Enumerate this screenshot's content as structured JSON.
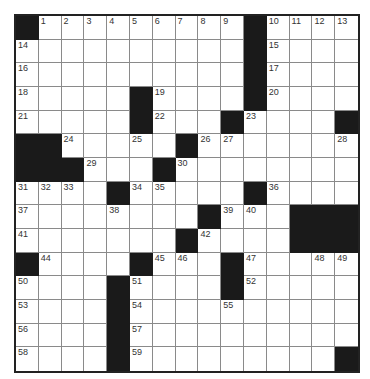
{
  "puzzle": {
    "rows": 15,
    "cols": 15,
    "colors": {
      "block": "#1a1a1a",
      "cell": "#ffffff",
      "gridline": "#8a8a8a",
      "border": "#222222",
      "number": "#333333"
    },
    "layout": [
      "#.........#....",
      "..........#....",
      "..........#....",
      ".....#....#....",
      ".....#...#....#",
      "##.....#.......",
      "###...#........",
      "....#.....#....",
      "........#...###",
      ".......#....###",
      "#....#...#.....",
      "....#....#.....",
      "....#..........",
      "....#..........",
      "....#.........#"
    ],
    "numbers": [
      {
        "r": 0,
        "c": 1,
        "n": "1"
      },
      {
        "r": 0,
        "c": 2,
        "n": "2"
      },
      {
        "r": 0,
        "c": 3,
        "n": "3"
      },
      {
        "r": 0,
        "c": 4,
        "n": "4"
      },
      {
        "r": 0,
        "c": 5,
        "n": "5"
      },
      {
        "r": 0,
        "c": 6,
        "n": "6"
      },
      {
        "r": 0,
        "c": 7,
        "n": "7"
      },
      {
        "r": 0,
        "c": 8,
        "n": "8"
      },
      {
        "r": 0,
        "c": 9,
        "n": "9"
      },
      {
        "r": 0,
        "c": 11,
        "n": "10"
      },
      {
        "r": 0,
        "c": 12,
        "n": "11"
      },
      {
        "r": 0,
        "c": 13,
        "n": "12"
      },
      {
        "r": 0,
        "c": 14,
        "n": "13"
      },
      {
        "r": 1,
        "c": 0,
        "n": "14"
      },
      {
        "r": 1,
        "c": 11,
        "n": "15"
      },
      {
        "r": 2,
        "c": 0,
        "n": "16"
      },
      {
        "r": 2,
        "c": 11,
        "n": "17"
      },
      {
        "r": 3,
        "c": 0,
        "n": "18"
      },
      {
        "r": 3,
        "c": 6,
        "n": "19"
      },
      {
        "r": 3,
        "c": 11,
        "n": "20"
      },
      {
        "r": 4,
        "c": 0,
        "n": "21"
      },
      {
        "r": 4,
        "c": 6,
        "n": "22"
      },
      {
        "r": 4,
        "c": 10,
        "n": "23"
      },
      {
        "r": 5,
        "c": 2,
        "n": "24"
      },
      {
        "r": 5,
        "c": 5,
        "n": "25"
      },
      {
        "r": 5,
        "c": 8,
        "n": "26"
      },
      {
        "r": 5,
        "c": 9,
        "n": "27"
      },
      {
        "r": 5,
        "c": 14,
        "n": "28"
      },
      {
        "r": 6,
        "c": 3,
        "n": "29"
      },
      {
        "r": 6,
        "c": 7,
        "n": "30"
      },
      {
        "r": 7,
        "c": 0,
        "n": "31"
      },
      {
        "r": 7,
        "c": 1,
        "n": "32"
      },
      {
        "r": 7,
        "c": 2,
        "n": "33"
      },
      {
        "r": 7,
        "c": 5,
        "n": "34"
      },
      {
        "r": 7,
        "c": 6,
        "n": "35"
      },
      {
        "r": 7,
        "c": 11,
        "n": "36"
      },
      {
        "r": 8,
        "c": 0,
        "n": "37"
      },
      {
        "r": 8,
        "c": 4,
        "n": "38"
      },
      {
        "r": 8,
        "c": 9,
        "n": "39"
      },
      {
        "r": 8,
        "c": 10,
        "n": "40"
      },
      {
        "r": 9,
        "c": 0,
        "n": "41"
      },
      {
        "r": 9,
        "c": 8,
        "n": "42"
      },
      {
        "r": 9,
        "c": 12,
        "n": "43"
      },
      {
        "r": 10,
        "c": 1,
        "n": "44"
      },
      {
        "r": 10,
        "c": 6,
        "n": "45"
      },
      {
        "r": 10,
        "c": 7,
        "n": "46"
      },
      {
        "r": 10,
        "c": 10,
        "n": "47"
      },
      {
        "r": 10,
        "c": 13,
        "n": "48"
      },
      {
        "r": 10,
        "c": 14,
        "n": "49"
      },
      {
        "r": 11,
        "c": 0,
        "n": "50"
      },
      {
        "r": 11,
        "c": 5,
        "n": "51"
      },
      {
        "r": 11,
        "c": 10,
        "n": "52"
      },
      {
        "r": 12,
        "c": 0,
        "n": "53"
      },
      {
        "r": 12,
        "c": 5,
        "n": "54"
      },
      {
        "r": 12,
        "c": 9,
        "n": "55"
      },
      {
        "r": 13,
        "c": 0,
        "n": "56"
      },
      {
        "r": 13,
        "c": 5,
        "n": "57"
      },
      {
        "r": 14,
        "c": 0,
        "n": "58"
      },
      {
        "r": 14,
        "c": 5,
        "n": "59"
      }
    ]
  }
}
